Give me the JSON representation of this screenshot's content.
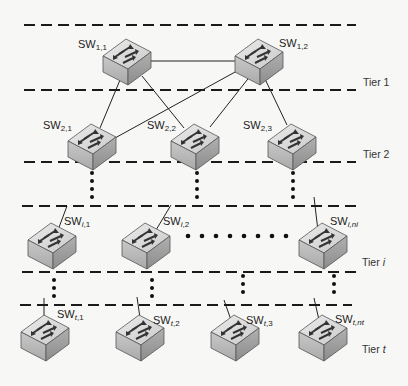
{
  "diagram": {
    "type": "hierarchical-switch-network",
    "tiers": [
      {
        "id": "tier-1",
        "label": "Tier 1",
        "label_italic_part": "",
        "switches": [
          {
            "id": "sw-1-1",
            "prefix": "SW",
            "sub": "1,1"
          },
          {
            "id": "sw-1-2",
            "prefix": "SW",
            "sub": "1,2"
          }
        ]
      },
      {
        "id": "tier-2",
        "label": "Tier 2",
        "label_italic_part": "",
        "switches": [
          {
            "id": "sw-2-1",
            "prefix": "SW",
            "sub": "2,1"
          },
          {
            "id": "sw-2-2",
            "prefix": "SW",
            "sub": "2,2"
          },
          {
            "id": "sw-2-3",
            "prefix": "SW",
            "sub": "2,3"
          }
        ]
      },
      {
        "id": "tier-i",
        "label": "Tier ",
        "label_italic_part": "i",
        "switches": [
          {
            "id": "sw-i-1",
            "prefix": "SW",
            "sub_italic": "i",
            "sub": ",1"
          },
          {
            "id": "sw-i-2",
            "prefix": "SW",
            "sub_italic": "i",
            "sub": ",2"
          },
          {
            "id": "sw-i-ni",
            "prefix": "SW",
            "sub_italic": "i,ni",
            "sub": ""
          }
        ]
      },
      {
        "id": "tier-t",
        "label": "Tier ",
        "label_italic_part": "t",
        "switches": [
          {
            "id": "sw-t-1",
            "prefix": "SW",
            "sub_italic": "t",
            "sub": ",1"
          },
          {
            "id": "sw-t-2",
            "prefix": "SW",
            "sub_italic": "t",
            "sub": ",2"
          },
          {
            "id": "sw-t-3",
            "prefix": "SW",
            "sub_italic": "t",
            "sub": ",3"
          },
          {
            "id": "sw-t-nt",
            "prefix": "SW",
            "sub_italic": "t,nt",
            "sub": ""
          }
        ]
      }
    ],
    "links": [
      [
        "SW1,1",
        "SW1,2"
      ],
      [
        "SW1,1",
        "SW2,1"
      ],
      [
        "SW1,1",
        "SW2,2"
      ],
      [
        "SW1,2",
        "SW2,1"
      ],
      [
        "SW1,2",
        "SW2,2"
      ],
      [
        "SW1,2",
        "SW2,3"
      ]
    ],
    "ellipsis": "vertical and horizontal dotted lines indicate omitted tiers/switches",
    "colors": {
      "dashed_line": "#1a1a1a",
      "link": "#222222",
      "switch_top": "#d8d8d8",
      "switch_front": "#bdbdbd",
      "switch_side": "#9a9a9a",
      "arrow": "#333333"
    }
  },
  "labels": {
    "sw_1_1": {
      "pre": "SW",
      "sub": "1,1"
    },
    "sw_1_2": {
      "pre": "SW",
      "sub": "1,2"
    },
    "sw_2_1": {
      "pre": "SW",
      "sub": "2,1"
    },
    "sw_2_2": {
      "pre": "SW",
      "sub": "2,2"
    },
    "sw_2_3": {
      "pre": "SW",
      "sub": "2,3"
    },
    "sw_i_1": {
      "pre": "SW",
      "sub_it": "i",
      "sub": ",1"
    },
    "sw_i_2": {
      "pre": "SW",
      "sub_it": "i",
      "sub": ",2"
    },
    "sw_i_ni": {
      "pre": "SW",
      "sub_it": "i,ni",
      "sub": ""
    },
    "sw_t_1": {
      "pre": "SW",
      "sub_it": "t",
      "sub": ",1"
    },
    "sw_t_2": {
      "pre": "SW",
      "sub_it": "t",
      "sub": ",2"
    },
    "sw_t_3": {
      "pre": "SW",
      "sub_it": "t",
      "sub": ",3"
    },
    "sw_t_nt": {
      "pre": "SW",
      "sub_it": "t,nt",
      "sub": ""
    },
    "tier_1": {
      "text": "Tier 1",
      "it": ""
    },
    "tier_2": {
      "text": "Tier 2",
      "it": ""
    },
    "tier_i": {
      "text": "Tier ",
      "it": "i"
    },
    "tier_t": {
      "text": "Tier ",
      "it": "t"
    }
  }
}
